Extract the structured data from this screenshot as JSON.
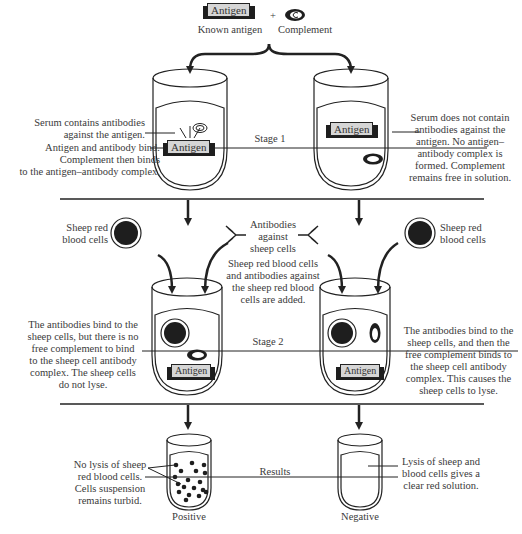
{
  "top": {
    "antigen_label": "Antigen",
    "known_antigen": "Known antigen",
    "plus": "+",
    "complement": "Complement"
  },
  "stage1": {
    "title": "Stage 1",
    "left_note_1": "Serum contains antibodies\nagainst the antigen.",
    "left_note_2": "Antigen and antibody bind.\nComplement then binds\nto the antigen–antibody complex.",
    "right_note": "Serum does not contain\nantibodies against the\nantigen. No antigen–\nantibody complex is\nformed. Complement\nremains free in solution.",
    "antigen_label": "Antigen"
  },
  "reagents": {
    "srbc_left": "Sheep red\nblood cells",
    "srbc_right": "Sheep red\nblood cells",
    "antibodies": "Antibodies\nagainst\nsheep cells",
    "added": "Sheep red blood cells\nand antibodies against\nthe sheep red blood\ncells are added."
  },
  "stage2": {
    "title": "Stage 2",
    "left_note": "The antibodies bind to the\nsheep cells, but there is no\nfree complement to bind\nto the sheep cell antibody\ncomplex. The sheep cells\ndo not lyse.",
    "right_note": "The antibodies bind to the\nsheep cells, and then the\nfree complement binds to\nthe sheep cell antibody\ncomplex. This causes the\nsheep cells to lyse.",
    "antigen_label": "Antigen"
  },
  "results": {
    "title": "Results",
    "left_note": "No lysis of sheep\nred blood cells.\nCells suspension\nremains turbid.",
    "right_note": "Lysis of sheep and\nblood cells gives a\nclear red solution.",
    "positive": "Positive",
    "negative": "Negative"
  },
  "colors": {
    "line": "#222222",
    "cell_fill": "#1e1e1e",
    "antigen_box": "#d6d6d6"
  }
}
